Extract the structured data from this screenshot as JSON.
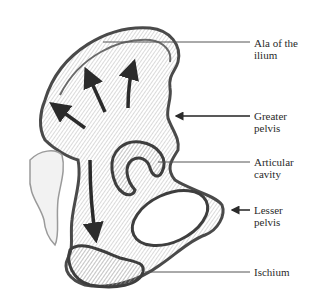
{
  "diagram": {
    "labels": [
      {
        "id": "ala",
        "line1": "Ala of the",
        "line2": "ilium",
        "pointer": "line"
      },
      {
        "id": "greater",
        "line1": "Greater",
        "line2": "pelvis",
        "pointer": "arrow"
      },
      {
        "id": "articular",
        "line1": "Articular",
        "line2": "cavity",
        "pointer": "line"
      },
      {
        "id": "lesser",
        "line1": "Lesser",
        "line2": "pelvis",
        "pointer": "arrow"
      },
      {
        "id": "ischium",
        "line1": "Ischium",
        "line2": "",
        "pointer": "line"
      }
    ],
    "arrows_in_ilium": 4,
    "colors": {
      "stroke": "#4a4a4a",
      "shade": "#9a9a9a",
      "arrow": "#2b2b2b",
      "background": "#ffffff"
    }
  }
}
